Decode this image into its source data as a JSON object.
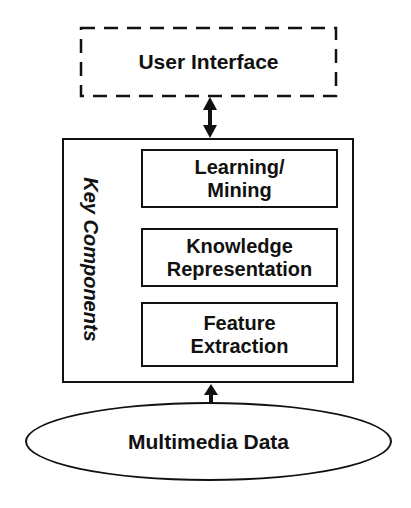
{
  "diagram": {
    "user_interface": {
      "label": "User Interface",
      "border_style": "dashed"
    },
    "key_components": {
      "title": "Key Components",
      "components": [
        {
          "label_line1": "Learning/",
          "label_line2": "Mining"
        },
        {
          "label_line1": "Knowledge",
          "label_line2": "Representation"
        },
        {
          "label_line1": "Feature",
          "label_line2": "Extraction"
        }
      ]
    },
    "data_source": {
      "label": "Multimedia Data",
      "shape": "ellipse"
    },
    "connections": [
      {
        "from": "User Interface",
        "to": "Key Components",
        "type": "bidirectional-arrow"
      },
      {
        "from": "Multimedia Data",
        "to": "Key Components",
        "type": "arrow-up"
      }
    ],
    "colors": {
      "stroke": "#111111",
      "background": "#ffffff"
    }
  }
}
